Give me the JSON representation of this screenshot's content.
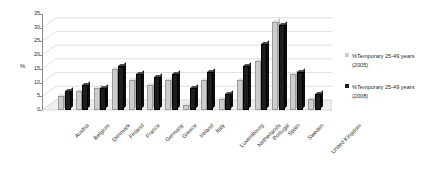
{
  "chart_data": {
    "type": "bar",
    "title": "",
    "xlabel": "",
    "ylabel": "%",
    "ylim": [
      0,
      35
    ],
    "yticks": [
      0,
      5,
      10,
      15,
      20,
      25,
      30,
      35
    ],
    "grid": true,
    "legend_position": "right",
    "categories": [
      "Austria",
      "Belgium",
      "Denmark",
      "Finland",
      "France",
      "Germany",
      "Greece",
      "Ireland",
      "Italy",
      "Luxembourg",
      "Netherlands",
      "Portugal",
      "Spain",
      "Sweden",
      "United Kingdom"
    ],
    "series": [
      {
        "name": "%Temporary 25-49 years (2005)",
        "color": "#cdcdcd",
        "values": [
          5,
          7,
          8,
          15,
          11,
          9,
          11,
          2,
          11,
          4,
          11,
          18,
          32,
          13,
          4
        ]
      },
      {
        "name": "%Temporary 25-49 years (2008)",
        "color": "#1d1d1d",
        "values": [
          7,
          9,
          8,
          16,
          13,
          12,
          13,
          8,
          14,
          6,
          16,
          24,
          31,
          14,
          6
        ]
      }
    ]
  },
  "legend": {
    "items": [
      {
        "label": "%Temporary 25-49 years (2005)",
        "color": "#cdcdcd"
      },
      {
        "label": "%Temporary 25-49 years (2008)",
        "color": "#1d1d1d"
      }
    ]
  },
  "axis": {
    "y_title": "%"
  }
}
